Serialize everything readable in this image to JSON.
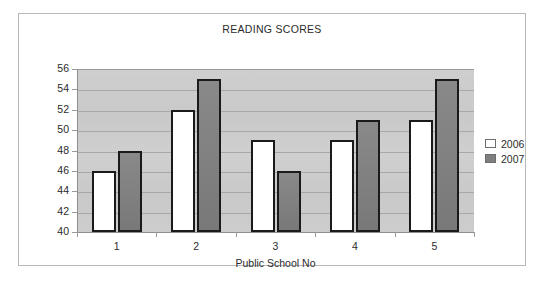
{
  "chart_data": {
    "type": "bar",
    "title": "READING SCORES",
    "xlabel": "Public School No",
    "ylabel": "",
    "categories": [
      "1",
      "2",
      "3",
      "4",
      "5"
    ],
    "series": [
      {
        "name": "2006",
        "color": "#ffffff",
        "values": [
          46,
          52,
          49,
          49,
          51
        ]
      },
      {
        "name": "2007",
        "color": "#7f7f7f",
        "values": [
          48,
          55,
          46,
          51,
          55
        ]
      }
    ],
    "ylim": [
      40,
      56
    ],
    "ytick_step": 2,
    "yticks": [
      40,
      42,
      44,
      46,
      48,
      50,
      52,
      54,
      56
    ],
    "grid": true,
    "legend_position": "right",
    "plot_background": "#c9c9c9",
    "bar_outline_color": "#1a1a1a",
    "frame_border_color": "#b9b9b9"
  },
  "legend": {
    "items": [
      {
        "label": "2006"
      },
      {
        "label": "2007"
      }
    ]
  }
}
